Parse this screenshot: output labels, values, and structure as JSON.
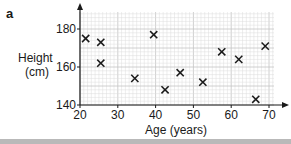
{
  "panel_label": "a",
  "chart_data": {
    "type": "scatter",
    "title": "",
    "xlabel": "Age (years)",
    "ylabel_lines": [
      "Height",
      "(cm)"
    ],
    "ylabel": "Height (cm)",
    "xlim": [
      20,
      73
    ],
    "ylim": [
      140,
      188
    ],
    "xticks": [
      20,
      30,
      40,
      50,
      60,
      70
    ],
    "yticks": [
      140,
      160,
      180
    ],
    "grid": true,
    "legend": null,
    "marker": "x",
    "points": [
      {
        "x": 21.5,
        "y": 175
      },
      {
        "x": 25.5,
        "y": 173
      },
      {
        "x": 25.5,
        "y": 162
      },
      {
        "x": 34.5,
        "y": 154
      },
      {
        "x": 39.5,
        "y": 177
      },
      {
        "x": 42.5,
        "y": 148
      },
      {
        "x": 46.5,
        "y": 157
      },
      {
        "x": 52.5,
        "y": 152
      },
      {
        "x": 57.5,
        "y": 168
      },
      {
        "x": 62,
        "y": 164
      },
      {
        "x": 66.5,
        "y": 143
      },
      {
        "x": 69,
        "y": 171
      }
    ]
  },
  "colors": {
    "axis": "#1a1a1a",
    "grid_minor": "#dcdcdc",
    "grid_major": "#c4c4c4",
    "marker": "#1a1a1a",
    "bottom_rule": "#b9b9b9"
  }
}
